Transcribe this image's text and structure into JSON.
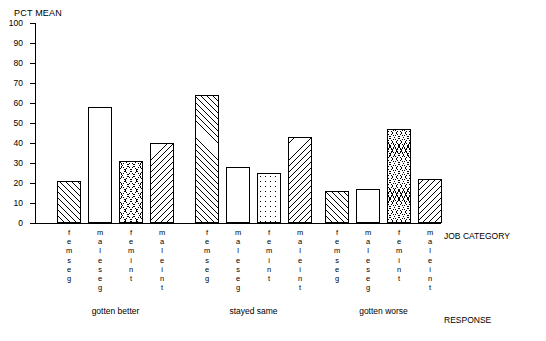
{
  "chart_data": {
    "type": "bar",
    "title": "PCT MEAN",
    "ylabel": "PCT MEAN",
    "xlabel": "RESPONSE",
    "group_axis_label": "JOB CATEGORY",
    "ylim": [
      0,
      100
    ],
    "yticks": [
      0,
      10,
      20,
      30,
      40,
      50,
      60,
      70,
      80,
      90,
      100
    ],
    "ytick_labels": [
      "0",
      "10",
      "20",
      "30",
      "40",
      "50",
      "60",
      "70",
      "80",
      "90",
      "100"
    ],
    "grid": false,
    "legend": "none",
    "categories": [
      "femseg",
      "maleseg",
      "femint",
      "maleint"
    ],
    "category_labels_vertical": [
      "f\ne\nm\ns\ne\ng",
      "m\na\nl\ne\ns\ne\ng",
      "f\ne\nm\ni\nn\nt",
      "m\na\nl\ne\ni\nn\nt"
    ],
    "groups": [
      "gotten better",
      "stayed same",
      "gotten worse"
    ],
    "fills": [
      "diag-up",
      "dots",
      "tri",
      "diag-down"
    ],
    "bars": [
      {
        "group": "gotten better",
        "category": "femseg",
        "value": 21,
        "fill": "diag-up"
      },
      {
        "group": "gotten better",
        "category": "maleseg",
        "value": 58,
        "fill": "dots"
      },
      {
        "group": "gotten better",
        "category": "femint",
        "value": 31,
        "fill": "tri"
      },
      {
        "group": "gotten better",
        "category": "maleint",
        "value": 40,
        "fill": "diag-down"
      },
      {
        "group": "stayed same",
        "category": "femseg",
        "value": 64,
        "fill": "diag-up"
      },
      {
        "group": "stayed same",
        "category": "maleseg",
        "value": 28,
        "fill": "dots"
      },
      {
        "group": "stayed same",
        "category": "femint",
        "value": 25,
        "fill": "dots-sparse"
      },
      {
        "group": "stayed same",
        "category": "maleint",
        "value": 43,
        "fill": "diag-down"
      },
      {
        "group": "gotten worse",
        "category": "femseg",
        "value": 16,
        "fill": "diag-up"
      },
      {
        "group": "gotten worse",
        "category": "maleseg",
        "value": 17,
        "fill": "dots"
      },
      {
        "group": "gotten worse",
        "category": "femint",
        "value": 47,
        "fill": "tri-dense"
      },
      {
        "group": "gotten worse",
        "category": "maleint",
        "value": 22,
        "fill": "diag-down"
      }
    ]
  },
  "axes": {
    "y_title": "PCT MEAN",
    "x_title": "RESPONSE",
    "group_title": "JOB CATEGORY"
  },
  "yticks": [
    {
      "label": "100",
      "value": 100
    },
    {
      "label": "90",
      "value": 90
    },
    {
      "label": "80",
      "value": 80
    },
    {
      "label": "70",
      "value": 70
    },
    {
      "label": "60",
      "value": 60
    },
    {
      "label": "50",
      "value": 50
    },
    {
      "label": "40",
      "value": 40
    },
    {
      "label": "30",
      "value": 30
    },
    {
      "label": "20",
      "value": 20
    },
    {
      "label": "10",
      "value": 10
    },
    {
      "label": "0",
      "value": 0
    }
  ],
  "catlabels": [
    {
      "text": "f\ne\nm\ns\ne\ng"
    },
    {
      "text": "m\na\nl\ne\ns\ne\ng"
    },
    {
      "text": "f\ne\nm\ni\nn\nt"
    },
    {
      "text": "m\na\nl\ne\ni\nn\nt"
    },
    {
      "text": "f\ne\nm\ns\ne\ng"
    },
    {
      "text": "m\na\nl\ne\ns\ne\ng"
    },
    {
      "text": "f\ne\nm\ni\nn\nt"
    },
    {
      "text": "m\na\nl\ne\ni\nn\nt"
    },
    {
      "text": "f\ne\nm\ns\ne\ng"
    },
    {
      "text": "m\na\nl\ne\ns\ne\ng"
    },
    {
      "text": "f\ne\nm\ni\nn\nt"
    },
    {
      "text": "m\na\nl\ne\ni\nn\nt"
    }
  ],
  "brackets": [
    {
      "label": "gotten better"
    },
    {
      "label": "stayed same"
    },
    {
      "label": "gotten worse"
    }
  ]
}
